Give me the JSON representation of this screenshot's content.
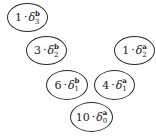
{
  "diagram": {
    "nodes": [
      {
        "id": "n1",
        "coefficient": "1",
        "operator": "·",
        "symbol": "δ",
        "superscript": "b",
        "subscript": "3",
        "x": 7,
        "y": 3,
        "w": 41,
        "h": 29
      },
      {
        "id": "n2",
        "coefficient": "3",
        "operator": "·",
        "symbol": "δ",
        "superscript": "b",
        "subscript": "2",
        "x": 26,
        "y": 36,
        "w": 41,
        "h": 29
      },
      {
        "id": "n3",
        "coefficient": "1",
        "operator": "·",
        "symbol": "δ",
        "superscript": "a",
        "subscript": "2",
        "x": 114,
        "y": 36,
        "w": 41,
        "h": 29
      },
      {
        "id": "n4",
        "coefficient": "6",
        "operator": "·",
        "symbol": "δ",
        "superscript": "b",
        "subscript": "1",
        "x": 46,
        "y": 70,
        "w": 42,
        "h": 30
      },
      {
        "id": "n5",
        "coefficient": "4",
        "operator": "·",
        "symbol": "δ",
        "superscript": "a",
        "subscript": "1",
        "x": 94,
        "y": 70,
        "w": 41,
        "h": 30
      },
      {
        "id": "n6",
        "coefficient": "10",
        "operator": "·",
        "symbol": "δ",
        "superscript": "a",
        "subscript": "0",
        "x": 70,
        "y": 102,
        "w": 43,
        "h": 30
      }
    ]
  }
}
